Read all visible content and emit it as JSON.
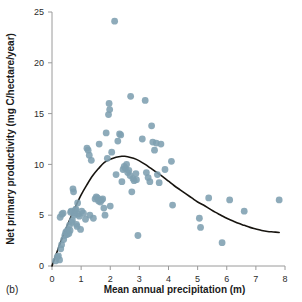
{
  "panel": {
    "label": "(b)"
  },
  "chart_data": {
    "type": "scatter",
    "title": "",
    "subtitle": "",
    "xlabel": "Mean annual precipitation (m)",
    "ylabel": "Net primary productivity (mg C/hectare/year)",
    "xlim": [
      0,
      8
    ],
    "ylim": [
      0,
      25
    ],
    "xticks": [
      0,
      1,
      2,
      3,
      4,
      5,
      6,
      7,
      8
    ],
    "yticks": [
      0,
      5,
      10,
      15,
      20,
      25
    ],
    "grid": false,
    "legend": null,
    "legend_position": "none",
    "marker_color": "#7e9fb0",
    "curve_color": "#17140f",
    "axis_color": "#9a9a9a",
    "points": [
      [
        0.12,
        0.5
      ],
      [
        0.18,
        0.9
      ],
      [
        0.22,
        1.0
      ],
      [
        0.26,
        0.6
      ],
      [
        0.3,
        1.7
      ],
      [
        0.33,
        2.1
      ],
      [
        0.28,
        4.8
      ],
      [
        0.34,
        5.1
      ],
      [
        0.38,
        5.2
      ],
      [
        0.4,
        2.6
      ],
      [
        0.44,
        3.0
      ],
      [
        0.47,
        3.3
      ],
      [
        0.5,
        3.4
      ],
      [
        0.52,
        3.1
      ],
      [
        0.55,
        3.6
      ],
      [
        0.58,
        3.2
      ],
      [
        0.6,
        4.0
      ],
      [
        0.62,
        3.5
      ],
      [
        0.64,
        5.3
      ],
      [
        0.66,
        5.4
      ],
      [
        0.68,
        4.3
      ],
      [
        0.7,
        4.5
      ],
      [
        0.72,
        7.6
      ],
      [
        0.74,
        7.3
      ],
      [
        0.76,
        5.0
      ],
      [
        0.78,
        5.2
      ],
      [
        0.8,
        5.5
      ],
      [
        0.82,
        5.6
      ],
      [
        0.84,
        4.1
      ],
      [
        0.86,
        3.9
      ],
      [
        0.88,
        6.2
      ],
      [
        0.9,
        5.1
      ],
      [
        0.94,
        4.9
      ],
      [
        0.98,
        3.6
      ],
      [
        1.02,
        5.4
      ],
      [
        1.08,
        5.2
      ],
      [
        1.15,
        4.6
      ],
      [
        1.2,
        11.6
      ],
      [
        1.24,
        11.4
      ],
      [
        1.28,
        10.9
      ],
      [
        1.3,
        5.0
      ],
      [
        1.35,
        10.4
      ],
      [
        1.42,
        4.7
      ],
      [
        1.48,
        6.6
      ],
      [
        1.52,
        6.8
      ],
      [
        1.56,
        6.7
      ],
      [
        1.6,
        6.4
      ],
      [
        1.62,
        12.0
      ],
      [
        1.66,
        6.3
      ],
      [
        1.7,
        6.5
      ],
      [
        1.74,
        6.6
      ],
      [
        1.78,
        5.7
      ],
      [
        1.82,
        5.0
      ],
      [
        1.86,
        13.1
      ],
      [
        1.9,
        10.6
      ],
      [
        1.94,
        14.9
      ],
      [
        1.96,
        16.0
      ],
      [
        1.98,
        15.4
      ],
      [
        2.0,
        5.9
      ],
      [
        2.05,
        11.2
      ],
      [
        2.15,
        24.1
      ],
      [
        2.2,
        9.0
      ],
      [
        2.26,
        12.3
      ],
      [
        2.32,
        13.0
      ],
      [
        2.36,
        12.9
      ],
      [
        2.4,
        8.3
      ],
      [
        2.44,
        9.5
      ],
      [
        2.48,
        9.8
      ],
      [
        2.52,
        9.6
      ],
      [
        2.56,
        10.0
      ],
      [
        2.6,
        9.2
      ],
      [
        2.64,
        9.4
      ],
      [
        2.68,
        8.9
      ],
      [
        2.7,
        16.7
      ],
      [
        2.74,
        7.3
      ],
      [
        2.78,
        8.6
      ],
      [
        2.82,
        8.4
      ],
      [
        2.88,
        9.1
      ],
      [
        2.9,
        8.5
      ],
      [
        2.95,
        3.0
      ],
      [
        3.1,
        12.5
      ],
      [
        3.2,
        16.3
      ],
      [
        3.24,
        9.2
      ],
      [
        3.3,
        8.7
      ],
      [
        3.36,
        8.3
      ],
      [
        3.42,
        13.8
      ],
      [
        3.46,
        12.2
      ],
      [
        3.52,
        11.4
      ],
      [
        3.58,
        12.1
      ],
      [
        3.62,
        9.0
      ],
      [
        3.68,
        8.2
      ],
      [
        3.74,
        12.0
      ],
      [
        3.88,
        9.5
      ],
      [
        4.1,
        10.3
      ],
      [
        4.14,
        6.0
      ],
      [
        5.06,
        4.7
      ],
      [
        5.1,
        3.8
      ],
      [
        5.38,
        6.7
      ],
      [
        5.84,
        2.3
      ],
      [
        6.1,
        6.5
      ],
      [
        6.6,
        5.4
      ],
      [
        7.8,
        6.5
      ]
    ],
    "fit_curve": {
      "description": "humped (unimodal) fitted response curve",
      "points": [
        [
          0.0,
          0.0
        ],
        [
          0.2,
          1.6
        ],
        [
          0.4,
          3.1
        ],
        [
          0.6,
          4.5
        ],
        [
          0.8,
          5.8
        ],
        [
          1.0,
          7.0
        ],
        [
          1.2,
          8.0
        ],
        [
          1.4,
          8.9
        ],
        [
          1.6,
          9.6
        ],
        [
          1.8,
          10.2
        ],
        [
          2.0,
          10.5
        ],
        [
          2.2,
          10.7
        ],
        [
          2.4,
          10.8
        ],
        [
          2.5,
          10.8
        ],
        [
          2.6,
          10.75
        ],
        [
          2.8,
          10.6
        ],
        [
          3.0,
          10.35
        ],
        [
          3.2,
          10.0
        ],
        [
          3.4,
          9.6
        ],
        [
          3.6,
          9.2
        ],
        [
          3.8,
          8.8
        ],
        [
          4.0,
          8.35
        ],
        [
          4.2,
          7.9
        ],
        [
          4.4,
          7.5
        ],
        [
          4.6,
          7.1
        ],
        [
          4.8,
          6.7
        ],
        [
          5.0,
          6.3
        ],
        [
          5.2,
          6.0
        ],
        [
          5.4,
          5.65
        ],
        [
          5.6,
          5.3
        ],
        [
          5.8,
          5.0
        ],
        [
          6.0,
          4.7
        ],
        [
          6.2,
          4.45
        ],
        [
          6.4,
          4.2
        ],
        [
          6.6,
          4.0
        ],
        [
          6.8,
          3.8
        ],
        [
          7.0,
          3.65
        ],
        [
          7.2,
          3.5
        ],
        [
          7.4,
          3.4
        ],
        [
          7.6,
          3.35
        ],
        [
          7.8,
          3.3
        ]
      ]
    }
  }
}
